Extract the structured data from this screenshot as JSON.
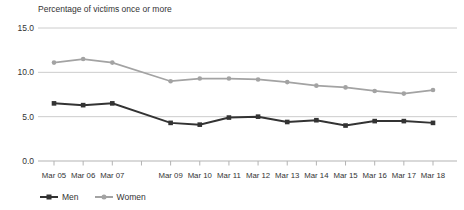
{
  "chart_data": {
    "type": "line",
    "title": "Percentage of victims once or more",
    "categories": [
      "Mar 05",
      "Mar 06",
      "Mar 07",
      "Mar 08",
      "Mar 09",
      "Mar 10",
      "Mar 11",
      "Mar 12",
      "Mar 13",
      "Mar 14",
      "Mar 15",
      "Mar 16",
      "Mar 17",
      "Mar 18"
    ],
    "x_tick_labels": [
      "Mar 05",
      "Mar 06",
      "Mar 07",
      "",
      "Mar 09",
      "Mar 10",
      "Mar 11",
      "Mar 12",
      "Mar 13",
      "Mar 14",
      "Mar 15",
      "Mar 16",
      "Mar 17",
      "Mar 18"
    ],
    "series": [
      {
        "name": "Men",
        "color": "#333333",
        "marker": "square",
        "values": [
          6.5,
          6.3,
          6.5,
          null,
          4.3,
          4.1,
          4.9,
          5.0,
          4.4,
          4.6,
          4.0,
          4.5,
          4.5,
          4.3
        ]
      },
      {
        "name": "Women",
        "color": "#a3a3a3",
        "marker": "circle",
        "values": [
          11.1,
          11.5,
          11.1,
          null,
          9.0,
          9.3,
          9.3,
          9.2,
          8.9,
          8.5,
          8.3,
          7.9,
          7.6,
          8.0
        ]
      }
    ],
    "xlabel": "",
    "ylabel": "Percentage of victims once or more",
    "ylim": [
      0,
      15
    ],
    "yticks": [
      {
        "value": 0,
        "label": "0.0"
      },
      {
        "value": 5,
        "label": "5.0"
      },
      {
        "value": 10,
        "label": "10.0"
      },
      {
        "value": 15,
        "label": "15.0"
      }
    ],
    "grid": "horizontal",
    "legend_position": "bottom-left",
    "note": "No data point for Mar 08; lines connect Mar 07 directly to Mar 09"
  },
  "legend": {
    "items": [
      {
        "label": "Men"
      },
      {
        "label": "Women"
      }
    ]
  },
  "colors": {
    "background": "#ffffff",
    "gridline": "#cccccc",
    "axis": "#b3b3b3",
    "text": "#333333",
    "men_line": "#333333",
    "women_line": "#a3a3a3"
  }
}
